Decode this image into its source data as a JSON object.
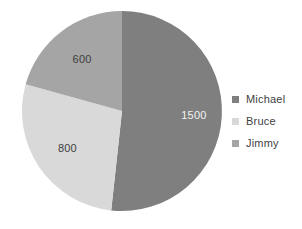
{
  "chart_data": {
    "type": "pie",
    "title": "",
    "categories": [
      "Michael",
      "Bruce",
      "Jimmy"
    ],
    "values": [
      1500,
      800,
      600
    ],
    "total": 2900,
    "labels": [
      "1500",
      "800",
      "600"
    ],
    "colors": [
      "#7f7f7f",
      "#d9d9d9",
      "#a5a5a5"
    ],
    "legend_position": "right",
    "grid": false,
    "start_angle_deg": 0,
    "direction": "clockwise",
    "slices": [
      {
        "name": "Michael",
        "value": 1500,
        "label": "1500",
        "color": "#7f7f7f",
        "start_deg": 0,
        "sweep_deg": 186.2,
        "label_on_dark": true
      },
      {
        "name": "Bruce",
        "value": 800,
        "label": "800",
        "color": "#d9d9d9",
        "start_deg": 186.2,
        "sweep_deg": 99.3,
        "label_on_dark": false
      },
      {
        "name": "Jimmy",
        "value": 600,
        "label": "600",
        "color": "#a5a5a5",
        "start_deg": 285.5,
        "sweep_deg": 74.5,
        "label_on_dark": false
      }
    ]
  },
  "legend": {
    "items": [
      {
        "label": "Michael",
        "color": "#7f7f7f"
      },
      {
        "label": "Bruce",
        "color": "#d9d9d9"
      },
      {
        "label": "Jimmy",
        "color": "#a5a5a5"
      }
    ]
  },
  "geometry": {
    "cx": 122,
    "cy": 111,
    "r": 100
  }
}
